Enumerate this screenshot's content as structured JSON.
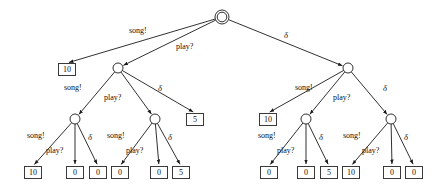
{
  "figure": {
    "type": "game-tree",
    "actions": {
      "song": "song!",
      "play": "play?",
      "delta": "δ"
    }
  },
  "nodes": {
    "root": {
      "id": "root",
      "kind": "double-circle",
      "x": 222,
      "y": 17
    },
    "midLeft": {
      "id": "n-l",
      "kind": "circle",
      "x": 118,
      "y": 68
    },
    "midRight": {
      "id": "n-r",
      "kind": "circle",
      "x": 348,
      "y": 68
    },
    "lowLL": {
      "id": "n-ll",
      "kind": "circle",
      "x": 75,
      "y": 119
    },
    "lowLR": {
      "id": "n-lr",
      "kind": "circle",
      "x": 155,
      "y": 119
    },
    "lowRL": {
      "id": "n-rl",
      "kind": "circle",
      "x": 306,
      "y": 119
    },
    "lowRR": {
      "id": "n-rr",
      "kind": "circle",
      "x": 391,
      "y": 119
    }
  },
  "leaves": [
    {
      "id": "leaf-root-song",
      "value": "10",
      "x": 58,
      "y": 63
    },
    {
      "id": "leaf-l-delta",
      "value": "5",
      "x": 186,
      "y": 113
    },
    {
      "id": "leaf-r-song",
      "value": "10",
      "x": 259,
      "y": 113
    },
    {
      "id": "leaf-ll-song",
      "value": "10",
      "x": 24,
      "y": 166
    },
    {
      "id": "leaf-ll-play",
      "value": "0",
      "x": 66,
      "y": 166
    },
    {
      "id": "leaf-ll-delta",
      "value": "0",
      "x": 89,
      "y": 166
    },
    {
      "id": "leaf-lr-song",
      "value": "0",
      "x": 111,
      "y": 166
    },
    {
      "id": "leaf-lr-play",
      "value": "0",
      "x": 150,
      "y": 166
    },
    {
      "id": "leaf-lr-delta",
      "value": "5",
      "x": 172,
      "y": 166
    },
    {
      "id": "leaf-rl-song",
      "value": "0",
      "x": 260,
      "y": 166
    },
    {
      "id": "leaf-rl-play",
      "value": "0",
      "x": 297,
      "y": 166
    },
    {
      "id": "leaf-rl-delta",
      "value": "5",
      "x": 320,
      "y": 166
    },
    {
      "id": "leaf-rr-song",
      "value": "10",
      "x": 342,
      "y": 166
    },
    {
      "id": "leaf-rr-play",
      "value": "0",
      "x": 383,
      "y": 166
    },
    {
      "id": "leaf-rr-delta",
      "value": "0",
      "x": 405,
      "y": 166
    }
  ],
  "edge_labels": [
    {
      "id": "lbl-root-song",
      "text": "song!",
      "x": 129,
      "y": 26
    },
    {
      "id": "lbl-root-play",
      "text": "play?",
      "x": 176,
      "y": 42
    },
    {
      "id": "lbl-root-delta",
      "text": "δ",
      "x": 284,
      "y": 31
    },
    {
      "id": "lbl-l-song",
      "text": "song!",
      "x": 64,
      "y": 83
    },
    {
      "id": "lbl-l-play",
      "text": "play?",
      "x": 104,
      "y": 93
    },
    {
      "id": "lbl-l-delta",
      "text": "δ",
      "x": 158,
      "y": 84
    },
    {
      "id": "lbl-r-song",
      "text": "song!",
      "x": 295,
      "y": 83
    },
    {
      "id": "lbl-r-play",
      "text": "play?",
      "x": 333,
      "y": 93
    },
    {
      "id": "lbl-r-delta",
      "text": "δ",
      "x": 383,
      "y": 84
    },
    {
      "id": "lbl-ll-song",
      "text": "song!",
      "x": 27,
      "y": 131
    },
    {
      "id": "lbl-ll-play",
      "text": "play?",
      "x": 46,
      "y": 146
    },
    {
      "id": "lbl-ll-delta",
      "text": "δ",
      "x": 88,
      "y": 133
    },
    {
      "id": "lbl-lr-song",
      "text": "song!",
      "x": 107,
      "y": 131
    },
    {
      "id": "lbl-lr-play",
      "text": "play?",
      "x": 126,
      "y": 146
    },
    {
      "id": "lbl-lr-delta",
      "text": "δ",
      "x": 168,
      "y": 133
    },
    {
      "id": "lbl-rl-song",
      "text": "song!",
      "x": 258,
      "y": 131
    },
    {
      "id": "lbl-rl-play",
      "text": "play?",
      "x": 277,
      "y": 146
    },
    {
      "id": "lbl-rl-delta",
      "text": "δ",
      "x": 319,
      "y": 133
    },
    {
      "id": "lbl-rr-song",
      "text": "song!",
      "x": 343,
      "y": 131
    },
    {
      "id": "lbl-rr-play",
      "text": "play?",
      "x": 362,
      "y": 146
    },
    {
      "id": "lbl-rr-delta",
      "text": "δ",
      "x": 404,
      "y": 133
    }
  ],
  "chart_data": {
    "type": "diagram",
    "title": "",
    "tree": {
      "node": "root",
      "shape": "double-circle",
      "children": [
        {
          "label": "song!",
          "node": "leaf",
          "value": "10"
        },
        {
          "label": "play?",
          "node": "circle",
          "children": [
            {
              "label": "song!",
              "node": "circle",
              "children": [
                {
                  "label": "song!",
                  "node": "leaf",
                  "value": "10"
                },
                {
                  "label": "play?",
                  "node": "leaf",
                  "value": "0"
                },
                {
                  "label": "δ",
                  "node": "leaf",
                  "value": "0"
                }
              ]
            },
            {
              "label": "play?",
              "node": "circle",
              "children": [
                {
                  "label": "song!",
                  "node": "leaf",
                  "value": "0"
                },
                {
                  "label": "play?",
                  "node": "leaf",
                  "value": "0"
                },
                {
                  "label": "δ",
                  "node": "leaf",
                  "value": "5"
                }
              ]
            },
            {
              "label": "δ",
              "node": "leaf",
              "value": "5"
            }
          ]
        },
        {
          "label": "δ",
          "node": "circle",
          "children": [
            {
              "label": "song!",
              "node": "leaf",
              "value": "10"
            },
            {
              "label": "play?",
              "node": "circle",
              "children": [
                {
                  "label": "song!",
                  "node": "leaf",
                  "value": "0"
                },
                {
                  "label": "play?",
                  "node": "leaf",
                  "value": "0"
                },
                {
                  "label": "δ",
                  "node": "leaf",
                  "value": "5"
                }
              ]
            },
            {
              "label": "δ",
              "node": "circle",
              "children": [
                {
                  "label": "song!",
                  "node": "leaf",
                  "value": "10"
                },
                {
                  "label": "play?",
                  "node": "leaf",
                  "value": "0"
                },
                {
                  "label": "δ",
                  "node": "leaf",
                  "value": "0"
                }
              ]
            }
          ]
        }
      ]
    }
  }
}
